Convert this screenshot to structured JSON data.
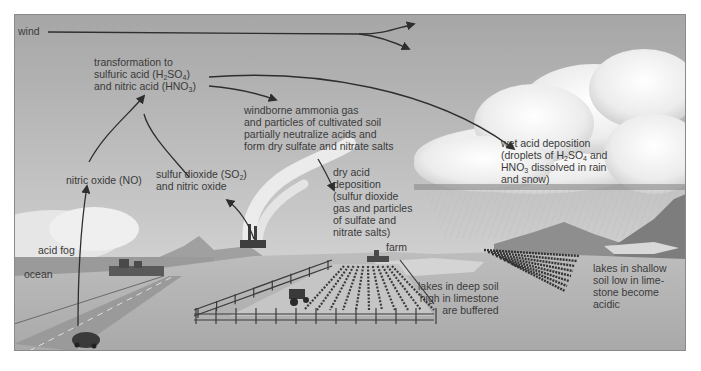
{
  "diagram": {
    "labels": {
      "wind": "wind",
      "transformation": {
        "line1": "transformation to",
        "line2_pre": "sulfuric acid (H",
        "line2_sub1": "2",
        "line2_mid": "SO",
        "line2_sub2": "4",
        "line2_post": ")",
        "line3_pre": "and nitric acid (HNO",
        "line3_sub": "3",
        "line3_post": ")"
      },
      "windborne": {
        "line1": "windborne ammonia gas",
        "line2": "and particles of cultivated soil",
        "line3": "partially neutralize acids and",
        "line4": "form dry sulfate and nitrate salts"
      },
      "wet_deposition": {
        "line1": "wet acid deposition",
        "line2_pre": "(droplets of H",
        "line2_sub1": "2",
        "line2_mid": "SO",
        "line2_sub2": "4",
        "line2_post": " and",
        "line3_pre": "HNO",
        "line3_sub": "3",
        "line3_post": " dissolved in rain",
        "line4": "and snow)"
      },
      "nitric_oxide": "nitric oxide (NO)",
      "sulfur_dioxide": {
        "line1_pre": "sulfur dioxide (SO",
        "line1_sub": "2",
        "line1_post": ")",
        "line2": "and nitric oxide"
      },
      "dry_deposition": {
        "line1": "dry acid",
        "line2": "deposition",
        "line3": "(sulfur dioxide",
        "line4": "gas and particles",
        "line5": "of sulfate and",
        "line6": "nitrate salts)"
      },
      "farm": "farm",
      "acid_fog": "acid fog",
      "ocean": "ocean",
      "lakes_deep": {
        "line1": "lakes in deep soil",
        "line2": "high in limestone",
        "line3": "are buffered"
      },
      "lakes_shallow": {
        "line1": "lakes in shallow",
        "line2": "soil low in lime-",
        "line3": "stone become",
        "line4": "acidic"
      }
    },
    "colors": {
      "sky_top": "#a9a9a9",
      "sky_bottom": "#dcdcdc",
      "ground": "#b4b4b4",
      "ocean": "#9a9a9a",
      "arrow": "#2e2e2e",
      "text": "#3a3a3a",
      "cloud": "#f4f4f4"
    }
  }
}
